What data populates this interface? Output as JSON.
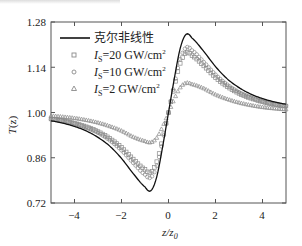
{
  "chart_data": {
    "type": "line",
    "title": "",
    "xlabel": "z/z0",
    "ylabel": "T(z)",
    "xlim": [
      -5,
      5
    ],
    "ylim": [
      0.72,
      1.28
    ],
    "xticks": [
      -4,
      -2,
      0,
      2,
      4
    ],
    "yticks": [
      0.72,
      0.86,
      1.0,
      1.14,
      1.28
    ],
    "ytick_labels": [
      "0.72",
      "0.86",
      "1.00",
      "1.14",
      "1.28"
    ],
    "xtick_labels": [
      "−4",
      "−2",
      "0",
      "2",
      "4"
    ],
    "grid": false,
    "legend_position": "upper left",
    "x": [
      -5,
      -4.5,
      -4,
      -3.5,
      -3,
      -2.5,
      -2,
      -1.5,
      -1,
      -0.75,
      -0.5,
      -0.25,
      0,
      0.25,
      0.5,
      0.75,
      1,
      1.5,
      2,
      2.5,
      3,
      3.5,
      4,
      4.5,
      5
    ],
    "series": [
      {
        "name": "克尔非线性",
        "style": "solid-line",
        "values": [
          0.974,
          0.967,
          0.957,
          0.943,
          0.923,
          0.896,
          0.858,
          0.811,
          0.77,
          0.758,
          0.801,
          0.894,
          1.0,
          1.106,
          1.199,
          1.242,
          1.23,
          1.189,
          1.142,
          1.104,
          1.077,
          1.057,
          1.043,
          1.033,
          1.026
        ]
      },
      {
        "name": "Is=20 GW/cm²",
        "style": "square-markers",
        "values": [
          0.98,
          0.975,
          0.967,
          0.956,
          0.941,
          0.92,
          0.892,
          0.856,
          0.824,
          0.815,
          0.848,
          0.919,
          1.0,
          1.081,
          1.152,
          1.185,
          1.176,
          1.144,
          1.108,
          1.08,
          1.059,
          1.044,
          1.033,
          1.025,
          1.02
        ]
      },
      {
        "name": "Is=10 GW/cm²",
        "style": "circle-markers",
        "values": [
          0.979,
          0.973,
          0.965,
          0.953,
          0.937,
          0.914,
          0.883,
          0.844,
          0.808,
          0.799,
          0.835,
          0.912,
          1.0,
          1.088,
          1.165,
          1.201,
          1.192,
          1.156,
          1.117,
          1.086,
          1.063,
          1.047,
          1.035,
          1.027,
          1.021
        ]
      },
      {
        "name": "Is=2 GW/cm²",
        "style": "triangle-markers",
        "values": [
          0.99,
          0.987,
          0.983,
          0.977,
          0.969,
          0.958,
          0.944,
          0.925,
          0.912,
          0.908,
          0.922,
          0.957,
          1.0,
          1.043,
          1.078,
          1.092,
          1.088,
          1.075,
          1.056,
          1.042,
          1.031,
          1.023,
          1.017,
          1.013,
          1.01
        ]
      }
    ]
  },
  "axes": {
    "xlabel_main": "z/z",
    "xlabel_sub": "0",
    "ylabel_main": "T",
    "ylabel_paren": "(z)"
  },
  "legend": {
    "items": [
      {
        "label": "克尔非线性"
      },
      {
        "label_prefix": "I",
        "label_sub": "S",
        "label_rest": "=20 GW/cm",
        "label_sup": "2"
      },
      {
        "label_prefix": "I",
        "label_sub": "S",
        "label_rest": "=10 GW/cm",
        "label_sup": "2"
      },
      {
        "label_prefix": "I",
        "label_sub": "S",
        "label_rest": "=2 GW/cm",
        "label_sup": "2"
      }
    ]
  },
  "colors": {
    "kerr_line": "#111111",
    "markers": "#8a8a8a",
    "axes": "#555555"
  }
}
